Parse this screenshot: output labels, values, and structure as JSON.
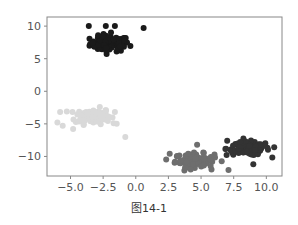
{
  "chart_data": {
    "type": "scatter",
    "title": "",
    "caption": "图14-1",
    "xlabel": "",
    "ylabel": "",
    "xlim": [
      -6.8,
      11.2
    ],
    "ylim": [
      -13.0,
      11.4
    ],
    "xticks": [
      -5.0,
      -2.5,
      0.0,
      2.5,
      5.0,
      7.5,
      10.0
    ],
    "xtick_labels": [
      "−5.0",
      "−2.5",
      "0.0",
      "2.5",
      "5.0",
      "7.5",
      "10.0"
    ],
    "yticks": [
      10,
      5,
      0,
      -5,
      -10
    ],
    "ytick_labels": [
      "10",
      "5",
      "0",
      "−5",
      "−10"
    ],
    "grid": false,
    "legend": "none",
    "series": [
      {
        "name": "cluster-1",
        "color": "#1a1a1a",
        "center": [
          -2.0,
          7.3
        ],
        "spread": [
          1.0,
          0.8
        ],
        "count": 100,
        "outliers": [
          [
            -3.6,
            10.0
          ],
          [
            -2.3,
            10.0
          ],
          [
            -1.6,
            10.0
          ],
          [
            0.6,
            9.7
          ],
          [
            -1.9,
            9.0
          ]
        ]
      },
      {
        "name": "cluster-2",
        "color": "#d9d9d9",
        "center": [
          -3.3,
          -3.8
        ],
        "spread": [
          0.9,
          0.8
        ],
        "count": 100,
        "outliers": [
          [
            -5.8,
            -3.2
          ],
          [
            -6.0,
            -4.8
          ],
          [
            -5.6,
            -5.3
          ],
          [
            -4.8,
            -5.8
          ],
          [
            -1.6,
            -3.2
          ],
          [
            -1.7,
            -4.9
          ],
          [
            -0.8,
            -7.0
          ]
        ]
      },
      {
        "name": "cluster-3",
        "color": "#6e6e6e",
        "center": [
          4.5,
          -10.6
        ],
        "spread": [
          1.0,
          0.7
        ],
        "count": 100,
        "outliers": [
          [
            4.7,
            -8.2
          ],
          [
            2.6,
            -9.6
          ],
          [
            5.8,
            -12.0
          ],
          [
            7.1,
            -12.1
          ]
        ]
      },
      {
        "name": "cluster-4",
        "color": "#333333",
        "center": [
          8.6,
          -8.8
        ],
        "spread": [
          1.1,
          0.7
        ],
        "count": 100,
        "outliers": [
          [
            7.0,
            -7.6
          ],
          [
            8.0,
            -7.8
          ],
          [
            10.6,
            -8.6
          ],
          [
            9.0,
            -11.2
          ]
        ]
      }
    ]
  }
}
